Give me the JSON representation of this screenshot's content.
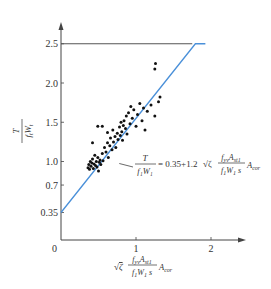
{
  "chart_data": {
    "type": "scatter",
    "title": "",
    "xlabel": "√ζ · f_yv A_st1 / (f_t W_t s) · A_cor",
    "ylabel": "T / (f_t W_t)",
    "xlim": [
      0,
      2.3
    ],
    "ylim": [
      0,
      2.7
    ],
    "grid": false,
    "x_ticks": [
      "0",
      "1",
      "2"
    ],
    "y_ticks": [
      "0.35",
      "0.7",
      "1.0",
      "1.5",
      "2.0",
      "2.5"
    ],
    "upper_limit_line": {
      "y": 2.5,
      "x_start": 0,
      "x_end": 1.75,
      "color": "#555555"
    },
    "fit_line": {
      "equation": "T/(f_t W_t) = 0.35 + 1.2 √ζ · f_yv A_st1 /(f_t W_t s) · A_cor",
      "intercept": 0.35,
      "slope": 1.2,
      "x_range": [
        0,
        1.79
      ],
      "cap": 2.5,
      "color": "#4a90d9"
    },
    "annotation": {
      "text_lhs_num": "T",
      "text_lhs_den": "f₁W₁",
      "text_eq": "= 0.35+1.2",
      "text_sqrt": "√ζ",
      "text_rhs_num": "f_yv A_st1",
      "text_rhs_den": "f₁W₁ s",
      "text_tail": "A_cor",
      "points_to": [
        0.75,
        1.0
      ]
    },
    "series": [
      {
        "name": "test data",
        "marker": "dot",
        "color": "#111111",
        "points": [
          [
            0.36,
            0.92
          ],
          [
            0.37,
            0.96
          ],
          [
            0.38,
            0.9
          ],
          [
            0.39,
            1.0
          ],
          [
            0.4,
            0.94
          ],
          [
            0.41,
            0.98
          ],
          [
            0.42,
            1.03
          ],
          [
            0.43,
            0.91
          ],
          [
            0.44,
            0.97
          ],
          [
            0.45,
            1.08
          ],
          [
            0.46,
            0.95
          ],
          [
            0.47,
            1.0
          ],
          [
            0.48,
            0.93
          ],
          [
            0.49,
            1.05
          ],
          [
            0.5,
            0.88
          ],
          [
            0.51,
            0.99
          ],
          [
            0.52,
            1.02
          ],
          [
            0.53,
            0.96
          ],
          [
            0.55,
            1.1
          ],
          [
            0.56,
            1.01
          ],
          [
            0.58,
            1.18
          ],
          [
            0.6,
            1.12
          ],
          [
            0.62,
            1.24
          ],
          [
            0.63,
            1.05
          ],
          [
            0.65,
            1.2
          ],
          [
            0.66,
            1.3
          ],
          [
            0.68,
            1.15
          ],
          [
            0.69,
            1.4
          ],
          [
            0.7,
            1.25
          ],
          [
            0.72,
            1.32
          ],
          [
            0.73,
            1.18
          ],
          [
            0.75,
            1.36
          ],
          [
            0.76,
            1.28
          ],
          [
            0.78,
            1.44
          ],
          [
            0.79,
            1.33
          ],
          [
            0.8,
            1.5
          ],
          [
            0.81,
            1.38
          ],
          [
            0.82,
            1.27
          ],
          [
            0.83,
            1.46
          ],
          [
            0.84,
            1.52
          ],
          [
            0.86,
            1.42
          ],
          [
            0.87,
            1.58
          ],
          [
            0.88,
            1.35
          ],
          [
            0.9,
            1.62
          ],
          [
            0.92,
            1.48
          ],
          [
            0.93,
            1.7
          ],
          [
            0.95,
            1.55
          ],
          [
            0.97,
            1.66
          ],
          [
            1.0,
            1.45
          ],
          [
            1.02,
            1.6
          ],
          [
            1.05,
            1.74
          ],
          [
            1.08,
            1.52
          ],
          [
            1.1,
            1.68
          ],
          [
            1.12,
            1.4
          ],
          [
            1.15,
            1.64
          ],
          [
            1.2,
            1.72
          ],
          [
            1.25,
            1.58
          ],
          [
            1.3,
            1.76
          ],
          [
            1.32,
            1.82
          ],
          [
            1.25,
            2.18
          ],
          [
            1.26,
            2.25
          ],
          [
            0.49,
            1.45
          ],
          [
            0.55,
            1.45
          ],
          [
            0.42,
            1.24
          ],
          [
            0.62,
            1.37
          ]
        ]
      }
    ]
  }
}
